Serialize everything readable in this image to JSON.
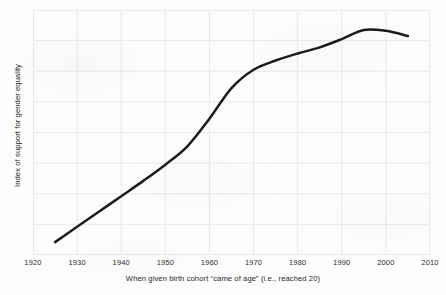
{
  "figure": {
    "background_color": "#fdfdfd",
    "plot_background_color": "#ffffff"
  },
  "chart_data": {
    "type": "line",
    "title": "",
    "subtitle": "",
    "xlabel": "When given birth cohort “came of age” (i.e., reached 20)",
    "ylabel": "Index of support for gender equality",
    "xlim": [
      1920,
      2010
    ],
    "ylim": [
      0,
      8
    ],
    "grid": true,
    "grid_color": "#e9e9e9",
    "legend": null,
    "legend_position": "none",
    "xticks": [
      1920,
      1930,
      1940,
      1950,
      1960,
      1970,
      1980,
      1990,
      2000,
      2010
    ],
    "xtick_labels": [
      "1920",
      "1930",
      "1940",
      "1950",
      "1960",
      "1970",
      "1980",
      "1990",
      "2000",
      "2010"
    ],
    "yticks": [
      0,
      1,
      2,
      3,
      4,
      5,
      6,
      7,
      8
    ],
    "ytick_labels": [
      "",
      "",
      "",
      "",
      "",
      "",
      "",
      "",
      ""
    ],
    "series": [
      {
        "name": "Index of support for gender equality",
        "color": "#1c1c1c",
        "line_width": 2.5,
        "x": [
          1925,
          1930,
          1935,
          1940,
          1945,
          1950,
          1955,
          1960,
          1965,
          1970,
          1975,
          1980,
          1985,
          1990,
          1995,
          2000,
          2005
        ],
        "values": [
          0.42,
          0.92,
          1.42,
          1.92,
          2.42,
          2.95,
          3.55,
          4.45,
          5.45,
          6.05,
          6.35,
          6.58,
          6.78,
          7.05,
          7.35,
          7.32,
          7.15
        ]
      }
    ]
  },
  "axes": {
    "x_tick_labels": [
      "1920",
      "1930",
      "1940",
      "1950",
      "1960",
      "1970",
      "1980",
      "1990",
      "2000",
      "2010"
    ],
    "x_title": "When given birth cohort “came of age” (i.e., reached 20)",
    "y_title": "Index of support for gender equality"
  }
}
